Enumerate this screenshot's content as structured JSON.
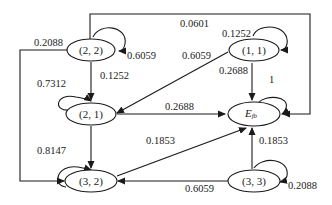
{
  "diagram": {
    "type": "state-transition",
    "nodes": [
      {
        "id": "n22",
        "label": "(2, 2)"
      },
      {
        "id": "n11",
        "label": "(1, 1)"
      },
      {
        "id": "n21",
        "label": "(2, 1)"
      },
      {
        "id": "nEfb",
        "label": "E",
        "subscript": "fb"
      },
      {
        "id": "n32",
        "label": "(3, 2)"
      },
      {
        "id": "n33",
        "label": "(3, 3)"
      }
    ],
    "edges": [
      {
        "from": "(2, 2)",
        "to": "E_fb",
        "label": "0.0601"
      },
      {
        "from": "(2, 2)",
        "to": "(2, 2)",
        "label": "0.6059"
      },
      {
        "from": "(2, 2)",
        "to": "(3, 2)",
        "label": "0.2088"
      },
      {
        "from": "(2, 2)",
        "to": "(2, 1)",
        "label": "0.1252"
      },
      {
        "from": "(1, 1)",
        "to": "(1, 1)",
        "label": "0.1252"
      },
      {
        "from": "(1, 1)",
        "to": "(2, 1)",
        "label": "0.6059"
      },
      {
        "from": "(1, 1)",
        "to": "E_fb",
        "label": "0.2688"
      },
      {
        "from": "E_fb",
        "to": "E_fb",
        "label": "1"
      },
      {
        "from": "(2, 1)",
        "to": "(2, 1)",
        "label": "0.7312"
      },
      {
        "from": "(2, 1)",
        "to": "E_fb",
        "label": "0.2688"
      },
      {
        "from": "(2, 1)",
        "to": "(3, 2)",
        "label": "0.8147"
      },
      {
        "from": "(3, 2)",
        "to": "E_fb",
        "label": "0.1853"
      },
      {
        "from": "(3, 3)",
        "to": "E_fb",
        "label": "0.1853"
      },
      {
        "from": "(3, 3)",
        "to": "(3, 2)",
        "label": "0.6059"
      },
      {
        "from": "(3, 3)",
        "to": "(3, 3)",
        "label": "0.2088"
      }
    ]
  }
}
